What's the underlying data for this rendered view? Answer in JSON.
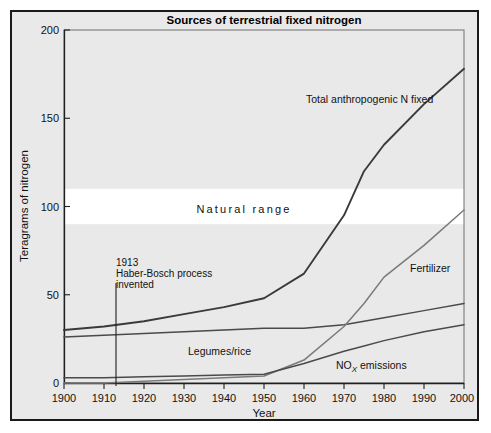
{
  "figure": {
    "title": "Sources of terrestrial fixed nitrogen",
    "background_color": "#e9e9e9",
    "border_color": "#1a1a1a",
    "band_color": "#ffffff"
  },
  "axes": {
    "x_label": "Year",
    "y_label": "Teragrams of nitrogen",
    "x_ticks": [
      "1900",
      "1910",
      "1920",
      "1930",
      "1940",
      "1950",
      "1960",
      "1970",
      "1980",
      "1990",
      "2000"
    ],
    "y_ticks": [
      "0",
      "50",
      "100",
      "150",
      "200"
    ]
  },
  "labels": {
    "total": "Total anthropogenic N fixed",
    "fertilizer": "Fertilizer",
    "legumes": "Legumes/rice",
    "nox_prefix": "NO",
    "nox_sub": "X",
    "nox_suffix": " emissions",
    "natural_range": "Natural range"
  },
  "annotation": {
    "year": "1913",
    "line1": "Haber-Bosch process",
    "line2": "invented"
  },
  "chart_data": {
    "type": "line",
    "title": "Sources of terrestrial fixed nitrogen",
    "xlabel": "Year",
    "ylabel": "Teragrams of nitrogen",
    "xlim": [
      1900,
      2000
    ],
    "ylim": [
      0,
      200
    ],
    "grid": false,
    "legend": "inline-curve-labels",
    "x": [
      1900,
      1910,
      1920,
      1930,
      1940,
      1950,
      1960,
      1970,
      1975,
      1980,
      1990,
      2000
    ],
    "series": [
      {
        "name": "Total anthropogenic N fixed",
        "values": [
          30,
          32,
          35,
          39,
          43,
          48,
          62,
          95,
          120,
          135,
          158,
          178
        ]
      },
      {
        "name": "Legumes/rice",
        "values": [
          26,
          27,
          28,
          29,
          30,
          31,
          31,
          33,
          35,
          37,
          41,
          45
        ]
      },
      {
        "name": "Fertilizer",
        "values": [
          0,
          0,
          1,
          2,
          3,
          4,
          13,
          32,
          45,
          60,
          78,
          98
        ]
      },
      {
        "name": "NOX emissions",
        "values": [
          3,
          3,
          3.5,
          4,
          4.5,
          5,
          11,
          18,
          21,
          24,
          29,
          33
        ]
      }
    ],
    "bands": [
      {
        "name": "Natural range",
        "y_min": 90,
        "y_max": 110,
        "color": "#ffffff"
      }
    ],
    "annotations": [
      {
        "text": "1913 Haber-Bosch process invented",
        "x": 1913,
        "y_top": 70,
        "y_bottom": 0
      }
    ]
  }
}
